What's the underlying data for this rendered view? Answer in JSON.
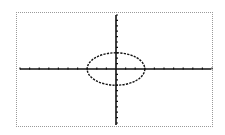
{
  "chart_data": {
    "type": "line",
    "title": "",
    "xlabel": "",
    "ylabel": "",
    "xlim": [
      -10,
      10
    ],
    "ylim": [
      -10,
      10
    ],
    "xscl": 1,
    "yscl": 1,
    "grid": false,
    "axes_color": "#111111",
    "border_color": "#9a9a9a",
    "series": [
      {
        "name": "ellipse",
        "shape": "ellipse",
        "center": [
          0,
          0
        ],
        "x_radius": 3,
        "y_radius": 3,
        "style": "dashed",
        "color": "#111111"
      }
    ]
  }
}
